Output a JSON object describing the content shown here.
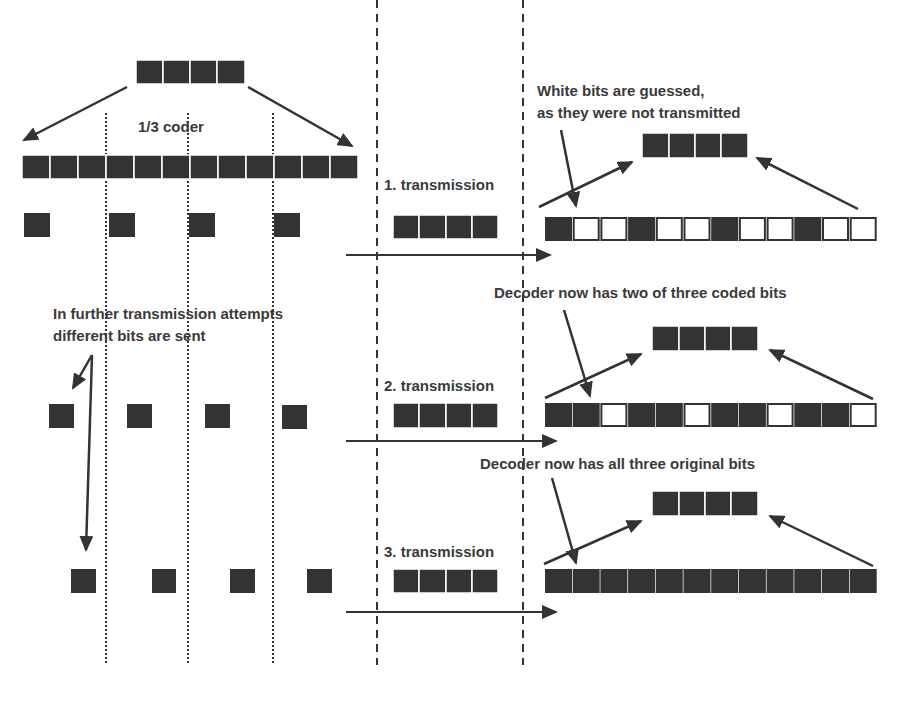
{
  "colors": {
    "bit_fill": "#333333",
    "bit_empty": "#ffffff",
    "line": "#333333",
    "text": "#3a3a3a"
  },
  "labels": {
    "coder": "1/3 coder",
    "guessed_line1": "White bits are guessed,",
    "guessed_line2": "as they were not transmitted",
    "further_line1": "In further transmission attempts",
    "further_line2": "different bits are sent",
    "decoder_two": "Decoder now has two of three coded bits",
    "decoder_all": "Decoder now has all three original bits",
    "tx1": "1. transmission",
    "tx2": "2. transmission",
    "tx3": "3. transmission"
  },
  "encoder": {
    "input_bits": 4,
    "coded_bits": 12,
    "rate": "1/3"
  },
  "transmissions": [
    {
      "label": "1. transmission",
      "sent_bits": 4,
      "received_pattern": [
        1,
        0,
        0,
        1,
        0,
        0,
        1,
        0,
        0,
        1,
        0,
        0
      ]
    },
    {
      "label": "2. transmission",
      "sent_bits": 4,
      "received_pattern": [
        1,
        1,
        0,
        1,
        1,
        0,
        1,
        1,
        0,
        1,
        1,
        0
      ]
    },
    {
      "label": "3. transmission",
      "sent_bits": 4,
      "received_pattern": [
        1,
        1,
        1,
        1,
        1,
        1,
        1,
        1,
        1,
        1,
        1,
        1
      ]
    }
  ]
}
